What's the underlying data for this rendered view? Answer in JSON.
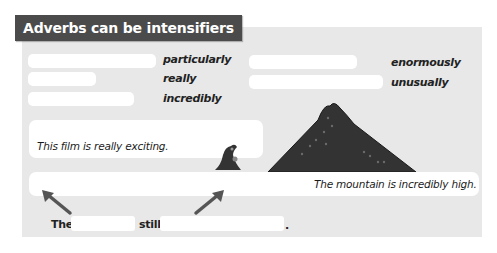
{
  "title": "Adverbs can be intensifiers",
  "word_bank": {
    "left": [
      "particularly",
      "really",
      "incredibly"
    ],
    "right": [
      "enormously",
      "unusually"
    ]
  },
  "examples": {
    "film": "This film is really exciting.",
    "mountain": "The mountain is incredibly high."
  },
  "fill_sentence": {
    "word1": "The",
    "word2": "still",
    "end": "."
  },
  "colors": {
    "title_bg": "#4b4b4b",
    "panel_bg": "#e8e8e8",
    "box_bg": "#ffffff",
    "mountain": "#333333",
    "arrow": "#555555"
  }
}
